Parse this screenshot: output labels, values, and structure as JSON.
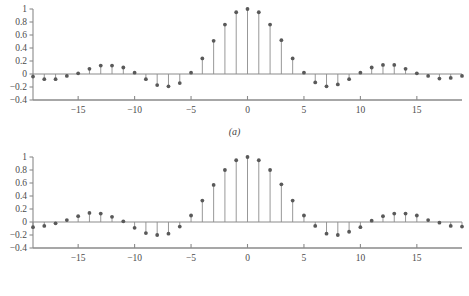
{
  "figure": {
    "background_color": "#ffffff",
    "stem_color": "#8c8c8c",
    "marker_color": "#595959",
    "axis_color": "#8a8a8a",
    "text_color": "#4c4c4c"
  },
  "panels": [
    {
      "id": "a",
      "caption": "(a)",
      "chart_data": {
        "type": "line",
        "plot_style": "stem",
        "title": "",
        "xlabel": "",
        "ylabel": "",
        "xlim": [
          -19,
          19
        ],
        "ylim": [
          -0.4,
          1.0
        ],
        "grid": false,
        "legend": "none",
        "xticks": [
          -15,
          -10,
          -5,
          0,
          5,
          10,
          15
        ],
        "xtick_labels": [
          "−15",
          "−10",
          "−5",
          "0",
          "5",
          "10",
          "15"
        ],
        "yticks": [
          -0.4,
          -0.2,
          0,
          0.2,
          0.4,
          0.6,
          0.8,
          1
        ],
        "ytick_labels": [
          "−0.4",
          "−0.2",
          "0",
          "0.2",
          "0.4",
          "0.6",
          "0.8",
          "1"
        ],
        "baseline": 0,
        "x": [
          -19,
          -18,
          -17,
          -16,
          -15,
          -14,
          -13,
          -12,
          -11,
          -10,
          -9,
          -8,
          -7,
          -6,
          -5,
          -4,
          -3,
          -2,
          -1,
          0,
          1,
          2,
          3,
          4,
          5,
          6,
          7,
          8,
          9,
          10,
          11,
          12,
          13,
          14,
          15,
          16,
          17,
          18,
          19
        ],
        "values": [
          -0.04,
          -0.08,
          -0.08,
          -0.03,
          0.01,
          0.08,
          0.13,
          0.13,
          0.1,
          0.02,
          -0.08,
          -0.17,
          -0.19,
          -0.14,
          0.02,
          0.24,
          0.51,
          0.76,
          0.95,
          1.0,
          0.95,
          0.76,
          0.52,
          0.24,
          0.02,
          -0.13,
          -0.19,
          -0.16,
          -0.08,
          0.02,
          0.1,
          0.14,
          0.14,
          0.08,
          0.01,
          -0.03,
          -0.07,
          -0.06,
          -0.03
        ]
      }
    },
    {
      "id": "b",
      "caption": "(b)",
      "chart_data": {
        "type": "line",
        "plot_style": "stem",
        "title": "",
        "xlabel": "",
        "ylabel": "",
        "xlim": [
          -19,
          19
        ],
        "ylim": [
          -0.4,
          1.0
        ],
        "grid": false,
        "legend": "none",
        "xticks": [
          -15,
          -10,
          -5,
          0,
          5,
          10,
          15
        ],
        "xtick_labels": [
          "−15",
          "−10",
          "−5",
          "0",
          "5",
          "10",
          "15"
        ],
        "yticks": [
          -0.4,
          -0.2,
          0,
          0.2,
          0.4,
          0.6,
          0.8,
          1
        ],
        "ytick_labels": [
          "−0.4",
          "−0.2",
          "0",
          "0.2",
          "0.4",
          "0.6",
          "0.8",
          "1"
        ],
        "baseline": 0,
        "x": [
          -19,
          -18,
          -17,
          -16,
          -15,
          -14,
          -13,
          -12,
          -11,
          -10,
          -9,
          -8,
          -7,
          -6,
          -5,
          -4,
          -3,
          -2,
          -1,
          0,
          1,
          2,
          3,
          4,
          5,
          6,
          7,
          8,
          9,
          10,
          11,
          12,
          13,
          14,
          15,
          16,
          17,
          18,
          19
        ],
        "values": [
          -0.08,
          -0.06,
          -0.02,
          0.03,
          0.09,
          0.14,
          0.13,
          0.08,
          0.01,
          -0.09,
          -0.17,
          -0.2,
          -0.18,
          -0.07,
          0.1,
          0.33,
          0.57,
          0.8,
          0.95,
          1.0,
          0.95,
          0.8,
          0.58,
          0.33,
          0.1,
          -0.06,
          -0.18,
          -0.2,
          -0.15,
          -0.08,
          0.02,
          0.09,
          0.13,
          0.13,
          0.1,
          0.03,
          -0.01,
          -0.06,
          -0.07
        ]
      }
    }
  ]
}
